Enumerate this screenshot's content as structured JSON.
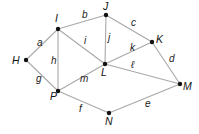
{
  "diagram": {
    "type": "graph",
    "nodes": [
      {
        "id": "H",
        "label": "H",
        "x": 26,
        "y": 60,
        "lx": 12,
        "ly": 64
      },
      {
        "id": "I",
        "label": "I",
        "x": 58,
        "y": 29,
        "lx": 55,
        "ly": 22
      },
      {
        "id": "J",
        "label": "J",
        "x": 106,
        "y": 15,
        "lx": 103,
        "ly": 10
      },
      {
        "id": "K",
        "label": "K",
        "x": 152,
        "y": 42,
        "lx": 156,
        "ly": 43
      },
      {
        "id": "L",
        "label": "L",
        "x": 105,
        "y": 64,
        "lx": 101,
        "ly": 76
      },
      {
        "id": "M",
        "label": "M",
        "x": 180,
        "y": 84,
        "lx": 183,
        "ly": 90
      },
      {
        "id": "N",
        "label": "N",
        "x": 109,
        "y": 113,
        "lx": 105,
        "ly": 125
      },
      {
        "id": "P",
        "label": "P",
        "x": 58,
        "y": 91,
        "lx": 50,
        "ly": 100
      }
    ],
    "edges": [
      {
        "label": "a",
        "from": "H",
        "to": "I",
        "lx": 37,
        "ly": 46
      },
      {
        "label": "b",
        "from": "I",
        "to": "J",
        "lx": 82,
        "ly": 18
      },
      {
        "label": "c",
        "from": "J",
        "to": "K",
        "lx": 131,
        "ly": 26
      },
      {
        "label": "d",
        "from": "K",
        "to": "M",
        "lx": 169,
        "ly": 62
      },
      {
        "label": "e",
        "from": "N",
        "to": "M",
        "lx": 145,
        "ly": 107
      },
      {
        "label": "f",
        "from": "P",
        "to": "N",
        "lx": 79,
        "ly": 112
      },
      {
        "label": "g",
        "from": "H",
        "to": "P",
        "lx": 36,
        "ly": 82
      },
      {
        "label": "h",
        "from": "I",
        "to": "P",
        "lx": 51,
        "ly": 64
      },
      {
        "label": "i",
        "from": "I",
        "to": "L",
        "lx": 84,
        "ly": 44
      },
      {
        "label": "j",
        "from": "J",
        "to": "L",
        "lx": 108,
        "ly": 41
      },
      {
        "label": "k",
        "from": "L",
        "to": "K",
        "lx": 130,
        "ly": 51
      },
      {
        "label": "ℓ",
        "from": "L",
        "to": "M",
        "lx": 131,
        "ly": 68
      },
      {
        "label": "m",
        "from": "P",
        "to": "L",
        "lx": 80,
        "ly": 82
      }
    ]
  }
}
